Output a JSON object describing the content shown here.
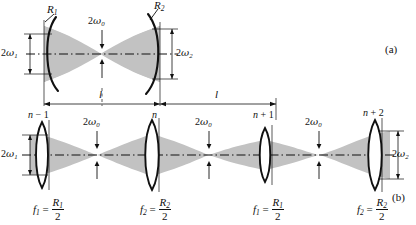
{
  "figure": {
    "panels": [
      {
        "id": "a",
        "label": "(a)",
        "caption": "Two-mirror resonator of length l with mirror radii R1 and R2"
      },
      {
        "id": "b",
        "label": "(b)",
        "caption": "Equivalent periodic sequence of lenses with f1 = R1/2 and f2 = R2/2"
      }
    ],
    "symbols": {
      "omega": "ω",
      "R": "R",
      "f": "f",
      "n": "n",
      "l": "l",
      "two": "2"
    }
  },
  "panel_a": {
    "panel_label": "(a)",
    "mirror_left_label": {
      "base": "R",
      "sub": "1"
    },
    "mirror_right_label": {
      "base": "R",
      "sub": "2"
    },
    "waist_label": {
      "prefix": "2",
      "greek": "ω",
      "sub": "0"
    },
    "left_spot_label": {
      "prefix": "2",
      "greek": "ω",
      "sub": "1"
    },
    "right_spot_label": {
      "prefix": "2",
      "greek": "ω",
      "sub": "2"
    },
    "length_label": "l"
  },
  "panel_b": {
    "panel_label": "(b)",
    "lenses": [
      {
        "index_label": {
          "base": "n",
          "op": "−",
          "num": "1"
        },
        "focal": {
          "f_sub": "1",
          "R_sub": "1",
          "den": "2"
        }
      },
      {
        "index_label": {
          "base": "n",
          "op": "",
          "num": ""
        },
        "focal": {
          "f_sub": "2",
          "R_sub": "2",
          "den": "2"
        }
      },
      {
        "index_label": {
          "base": "n",
          "op": "+",
          "num": "1"
        },
        "focal": {
          "f_sub": "1",
          "R_sub": "1",
          "den": "2"
        }
      },
      {
        "index_label": {
          "base": "n",
          "op": "+",
          "num": "2"
        },
        "focal": {
          "f_sub": "2",
          "R_sub": "2",
          "den": "2"
        }
      }
    ],
    "waist_labels": [
      {
        "prefix": "2",
        "greek": "ω",
        "sub": "0"
      },
      {
        "prefix": "2",
        "greek": "ω",
        "sub": "0"
      },
      {
        "prefix": "2",
        "greek": "ω",
        "sub": "0"
      }
    ],
    "left_spot_label": {
      "prefix": "2",
      "greek": "ω",
      "sub": "1"
    },
    "right_spot_label": {
      "prefix": "2",
      "greek": "ω",
      "sub": "2"
    },
    "length_labels": [
      "l",
      "l"
    ]
  },
  "colors": {
    "beam_fill": "#c2c2c2",
    "stroke": "#111111",
    "axis": "#222222",
    "background": "#ffffff"
  }
}
